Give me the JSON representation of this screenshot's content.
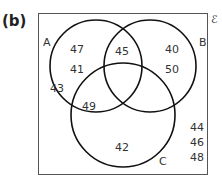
{
  "part_label": "(b)",
  "universal_symbol": "ℰ",
  "sets": [
    {
      "name": "A",
      "cx": 96,
      "cy": 66,
      "r": 46,
      "label_x": 43,
      "label_y": 46
    },
    {
      "name": "B",
      "cx": 150,
      "cy": 66,
      "r": 46,
      "label_x": 199,
      "label_y": 46
    },
    {
      "name": "C",
      "cx": 123,
      "cy": 115,
      "r": 52,
      "label_x": 159,
      "label_y": 165
    }
  ],
  "regions": [
    {
      "region": "A only",
      "values": [
        "47",
        "41",
        "43"
      ]
    },
    {
      "region": "A∩B only",
      "values": [
        "45"
      ]
    },
    {
      "region": "B only",
      "values": [
        "40",
        "50"
      ]
    },
    {
      "region": "A∩C only",
      "values": [
        "49"
      ]
    },
    {
      "region": "C only",
      "values": [
        "42"
      ]
    },
    {
      "region": "outside",
      "values": [
        "44",
        "46",
        "48"
      ]
    }
  ],
  "numbers": [
    {
      "text": "47",
      "x": 77,
      "y": 53
    },
    {
      "text": "41",
      "x": 77,
      "y": 73
    },
    {
      "text": "43",
      "x": 57,
      "y": 92
    },
    {
      "text": "45",
      "x": 122,
      "y": 55
    },
    {
      "text": "40",
      "x": 172,
      "y": 53
    },
    {
      "text": "50",
      "x": 172,
      "y": 73
    },
    {
      "text": "49",
      "x": 89,
      "y": 110
    },
    {
      "text": "42",
      "x": 122,
      "y": 151
    },
    {
      "text": "44",
      "x": 197,
      "y": 131
    },
    {
      "text": "46",
      "x": 197,
      "y": 146
    },
    {
      "text": "48",
      "x": 197,
      "y": 161
    }
  ],
  "colors": {
    "stroke": "#111111",
    "text": "#333333",
    "box": "#555555"
  }
}
